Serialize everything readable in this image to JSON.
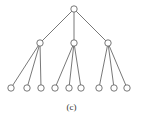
{
  "caption": "(c)",
  "tree": {
    "style": {
      "stroke": "#555555",
      "node_fill": "#ffffff",
      "node_radius": 3.2
    },
    "root": {
      "x": 74,
      "y": 9
    },
    "level1": [
      {
        "x": 40,
        "y": 43,
        "children": [
          {
            "x": 11,
            "y": 88
          },
          {
            "x": 27,
            "y": 88
          },
          {
            "x": 41,
            "y": 88
          }
        ]
      },
      {
        "x": 74,
        "y": 43,
        "children": [
          {
            "x": 55,
            "y": 88
          },
          {
            "x": 69,
            "y": 88
          },
          {
            "x": 81,
            "y": 88
          }
        ]
      },
      {
        "x": 108,
        "y": 43,
        "children": [
          {
            "x": 99,
            "y": 88
          },
          {
            "x": 114,
            "y": 88
          },
          {
            "x": 127,
            "y": 88
          }
        ]
      }
    ]
  }
}
